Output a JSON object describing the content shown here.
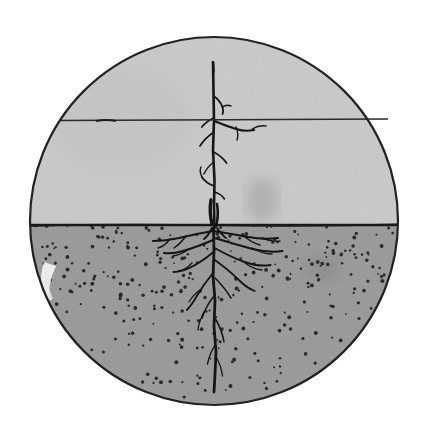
{
  "image": {
    "title": "Young sapling with root system in soil, circular vignette",
    "medium": "pen-and-ink illustration with gray wash",
    "canvas": {
      "width": 429,
      "height": 443,
      "background_color": "#ffffff"
    }
  },
  "vignette": {
    "shape": "circle",
    "center_x": 214,
    "center_y": 221,
    "radius": 184,
    "outline_color": "#222222",
    "outline_width": 2.2
  },
  "regions": {
    "sky": {
      "label": "sky",
      "fill_color": "#c9c9c9",
      "top_y": 30,
      "bottom_y": 225
    },
    "soil": {
      "label": "soil",
      "fill_color": "#9a9a9a",
      "top_y": 225,
      "bottom_y": 413,
      "stipple_color": "#2b2b2b",
      "stipple_count": 300
    }
  },
  "ground_line": {
    "label": "ground-line",
    "y": 225,
    "color": "#1a1a1a",
    "width": 2.4
  },
  "horizon_wire": {
    "label": "horizontal-line",
    "y": 120,
    "x_start": 60,
    "x_end": 388,
    "color": "#2a2a2a",
    "width": 1.6
  },
  "plant": {
    "label": "sapling",
    "ink_color": "#151515",
    "trunk_top_y": 62,
    "trunk_base_y": 228,
    "trunk_x": 214,
    "root_tip_y": 392,
    "lateral_root_left_x": 145,
    "lateral_root_right_x": 302
  },
  "highlight": {
    "label": "white-highlight-crescent",
    "color": "#f6f6f6",
    "x": 44,
    "y": 282
  },
  "smudges": [
    {
      "label": "sky-smudge",
      "x": 262,
      "y": 200,
      "color": "#9d9d9d"
    },
    {
      "label": "soil-smudge",
      "x": 320,
      "y": 268,
      "color": "#8a8a8a"
    }
  ]
}
